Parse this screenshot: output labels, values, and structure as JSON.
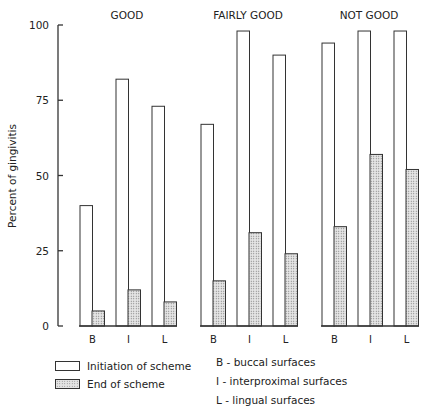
{
  "chart_data": {
    "type": "bar",
    "title": "",
    "ylabel": "Percent of gingivitis",
    "xlabel": "",
    "ylim": [
      0,
      100
    ],
    "yticks": [
      0,
      25,
      50,
      75,
      100
    ],
    "grid": false,
    "panels": [
      "GOOD",
      "FAIRLY GOOD",
      "NOT GOOD"
    ],
    "categories": [
      "B",
      "I",
      "L"
    ],
    "series": [
      {
        "name": "Initiation of scheme",
        "pattern": "open",
        "values": {
          "GOOD": [
            40,
            82,
            73
          ],
          "FAIRLY GOOD": [
            67,
            98,
            90
          ],
          "NOT GOOD": [
            94,
            98,
            98
          ]
        }
      },
      {
        "name": "End of scheme",
        "pattern": "stippled",
        "values": {
          "GOOD": [
            5,
            12,
            8
          ],
          "FAIRLY GOOD": [
            15,
            31,
            24
          ],
          "NOT GOOD": [
            33,
            57,
            52
          ]
        }
      }
    ],
    "legend": {
      "position": "bottom-left",
      "entries": [
        "Initiation of scheme",
        "End of scheme"
      ]
    },
    "key": [
      "B - buccal surfaces",
      "I - interproximal surfaces",
      "L - lingual surfaces"
    ]
  },
  "legend": {
    "initiation": "Initiation of scheme",
    "end": "End of scheme"
  },
  "key": {
    "b": "B - buccal surfaces",
    "i": "I - interproximal surfaces",
    "l": "L - lingual surfaces"
  },
  "colors": {
    "line": "#333333",
    "stipple_bg": "#e4e4e4",
    "stipple_dot": "#777777"
  }
}
